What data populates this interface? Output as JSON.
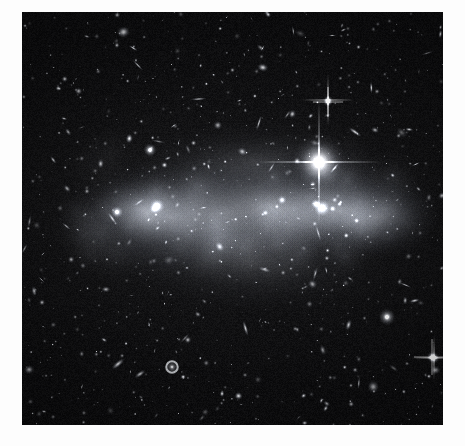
{
  "page": {
    "background_color": "#fdfdfd",
    "width": 465,
    "height": 446
  },
  "figure": {
    "name": "galaxy-cluster-deep-field",
    "frame": {
      "x": 22,
      "y": 12,
      "width": 421,
      "height": 413
    },
    "colors": {
      "sky_background": "#060608",
      "sky_background_mid": "#141417",
      "intracluster_light": "#b9bcc0",
      "source_white": "#ffffff",
      "frame_border": "#000000",
      "page_white": "#fdfdfd"
    },
    "caption": ""
  },
  "chart_data": {
    "type": "scatter",
    "title": "",
    "subtitle": "",
    "xlabel": "",
    "ylabel": "",
    "grid": false,
    "legend_position": "none",
    "xlim": [
      0,
      421
    ],
    "ylim": [
      0,
      413
    ],
    "diffuse_halos": [
      {
        "cx": 150,
        "cy": 205,
        "rx": 120,
        "ry": 62,
        "peak": 0.42,
        "rot": -4
      },
      {
        "cx": 250,
        "cy": 195,
        "rx": 130,
        "ry": 55,
        "peak": 0.36,
        "rot": -3
      },
      {
        "cx": 318,
        "cy": 198,
        "rx": 105,
        "ry": 60,
        "peak": 0.48,
        "rot": -2
      },
      {
        "cx": 205,
        "cy": 200,
        "rx": 190,
        "ry": 75,
        "peak": 0.3,
        "rot": -3
      },
      {
        "cx": 125,
        "cy": 200,
        "rx": 60,
        "ry": 40,
        "peak": 0.34,
        "rot": 0
      },
      {
        "cx": 355,
        "cy": 205,
        "rx": 70,
        "ry": 45,
        "peak": 0.4,
        "rot": 0
      },
      {
        "cx": 228,
        "cy": 250,
        "rx": 150,
        "ry": 55,
        "peak": 0.22,
        "rot": 2
      },
      {
        "cx": 230,
        "cy": 150,
        "rx": 140,
        "ry": 45,
        "peak": 0.2,
        "rot": -2
      }
    ],
    "bright_star": {
      "cx": 297,
      "cy": 150,
      "core_radius": 7,
      "spike_length": 62,
      "spike_width": 2.0,
      "brightness": 1.0,
      "label": "foreground star with diffraction spikes"
    },
    "named_sources": [
      {
        "cx": 300,
        "cy": 196,
        "r": 9.0,
        "kind": "elliptical",
        "brightness": 0.95,
        "rot": 0,
        "ell": 1.0
      },
      {
        "cx": 135,
        "cy": 194,
        "r": 8.0,
        "kind": "elliptical",
        "brightness": 0.92,
        "rot": 0,
        "ell": 1.0
      },
      {
        "cx": 95,
        "cy": 200,
        "r": 6.5,
        "kind": "elliptical",
        "brightness": 0.82,
        "rot": 0,
        "ell": 1.0
      },
      {
        "cx": 128,
        "cy": 138,
        "r": 7.0,
        "kind": "elliptical",
        "brightness": 0.88,
        "rot": 0,
        "ell": 1.0
      },
      {
        "cx": 294,
        "cy": 192,
        "r": 5.5,
        "kind": "elliptical",
        "brightness": 0.85,
        "rot": 0,
        "ell": 1.0
      },
      {
        "cx": 365,
        "cy": 305,
        "r": 9.0,
        "kind": "elliptical",
        "brightness": 0.8,
        "rot": 0,
        "ell": 1.0
      },
      {
        "cx": 150,
        "cy": 355,
        "r": 8.0,
        "kind": "ring",
        "brightness": 0.78,
        "rot": 0,
        "ell": 1.0
      },
      {
        "cx": 96,
        "cy": 352,
        "r": 9.0,
        "kind": "edge-on",
        "brightness": 0.8,
        "rot": -40,
        "ell": 0.35
      },
      {
        "cx": 118,
        "cy": 362,
        "r": 7.0,
        "kind": "edge-on",
        "brightness": 0.72,
        "rot": -35,
        "ell": 0.4
      },
      {
        "cx": 260,
        "cy": 188,
        "r": 5.0,
        "kind": "elliptical",
        "brightness": 0.7,
        "rot": 0,
        "ell": 1.0
      },
      {
        "cx": 333,
        "cy": 120,
        "r": 8.5,
        "kind": "edge-on",
        "brightness": 0.85,
        "rot": 35,
        "ell": 0.28
      },
      {
        "cx": 353,
        "cy": 118,
        "r": 4.5,
        "kind": "spiral",
        "brightness": 0.66,
        "rot": 20,
        "ell": 0.7
      },
      {
        "cx": 410,
        "cy": 345,
        "r": 6.0,
        "kind": "star",
        "brightness": 0.92,
        "rot": 0,
        "ell": 1.0
      },
      {
        "cx": 306,
        "cy": 90,
        "r": 5.0,
        "kind": "star",
        "brightness": 0.85,
        "rot": 0,
        "ell": 1.0
      }
    ],
    "point_source_count": 780,
    "galaxy_count": 210
  }
}
